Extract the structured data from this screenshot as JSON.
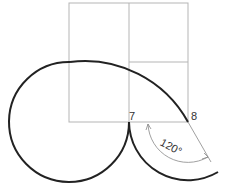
{
  "diagram": {
    "type": "geometric-construction",
    "grid": {
      "x": [
        69,
        129,
        188
      ],
      "y": [
        3,
        62,
        122
      ],
      "color": "#b5b5b5"
    },
    "points": [
      {
        "label": "7",
        "x": 129,
        "y": 122
      },
      {
        "label": "8",
        "x": 188,
        "y": 122
      }
    ],
    "curve_color": "#222222",
    "dimension": {
      "label": "120°",
      "color": "#888888"
    }
  }
}
